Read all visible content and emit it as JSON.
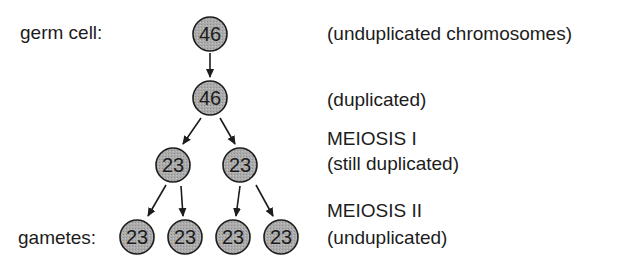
{
  "diagram": {
    "left_labels": {
      "germ_cell": "germ cell:",
      "gametes": "gametes:"
    },
    "right_labels": {
      "stage0": "(unduplicated chromosomes)",
      "stage1": "(duplicated)",
      "stage2_title": "MEIOSIS I",
      "stage2_desc": "(still duplicated)",
      "stage3_title": "MEIOSIS II",
      "stage3_desc": "(unduplicated)"
    },
    "cells": {
      "germ": "46",
      "duplicated": "46",
      "meiosis1_left": "23",
      "meiosis1_right": "23",
      "gamete_1": "23",
      "gamete_2": "23",
      "gamete_3": "23",
      "gamete_4": "23"
    },
    "colors": {
      "cell_fill": "#a8a8a8",
      "cell_stroke": "#1c1c1c",
      "arrow": "#1c1c1c"
    }
  }
}
